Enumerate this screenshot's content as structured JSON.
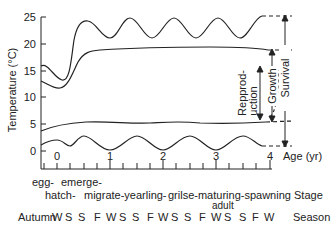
{
  "chart_data": {
    "type": "line",
    "title": "",
    "xlabel": "Age (yr)",
    "ylabel": "Temperature (°C)",
    "ylim": [
      0,
      25
    ],
    "xlim": [
      -0.3,
      4
    ],
    "y_ticks": [
      "0",
      "5",
      "10",
      "15",
      "20",
      "25"
    ],
    "x_ticks": [
      "0",
      "1",
      "2",
      "3",
      "4"
    ],
    "grid": false,
    "series": [
      {
        "name": "Upper survival limit",
        "x": [
          -0.3,
          0.1,
          0.55,
          1.0,
          1.4,
          1.9,
          2.4,
          2.9,
          3.4,
          3.65,
          4.0
        ],
        "values": [
          16,
          13,
          24,
          21,
          24.5,
          21,
          24.5,
          21,
          24.5,
          25,
          25
        ]
      },
      {
        "name": "Upper growth limit",
        "x": [
          -0.3,
          0.05,
          0.6,
          1.0,
          2.0,
          3.0,
          3.6,
          4.0
        ],
        "values": [
          13,
          11.8,
          18.5,
          18.9,
          19.1,
          19.1,
          18.5,
          18
        ]
      },
      {
        "name": "Lower growth limit",
        "x": [
          -0.3,
          0.5,
          1.0,
          2.0,
          3.0,
          3.6,
          4.0
        ],
        "values": [
          3.8,
          5.3,
          5.1,
          5.5,
          5.2,
          5.4,
          5.5
        ]
      },
      {
        "name": "Lower survival limit",
        "x": [
          -0.3,
          0.0,
          0.25,
          0.5,
          1.0,
          1.5,
          2.0,
          2.5,
          3.0,
          3.5,
          3.75,
          4.0
        ],
        "values": [
          1.0,
          2.0,
          1.0,
          2.8,
          0.2,
          2.8,
          0.2,
          2.8,
          0.2,
          2.8,
          0.8,
          0.8
        ]
      }
    ],
    "annotations": [
      "Survival",
      "Growth",
      "Repprod-uction"
    ]
  },
  "axis": {
    "y_label": "Temperature (°C)",
    "x_label": "Age (yr)",
    "y_ticks": [
      "25",
      "20",
      "15",
      "10",
      "5",
      "0"
    ],
    "x_ticks": [
      "0",
      "1",
      "2",
      "3",
      "4"
    ]
  },
  "brackets": {
    "survival": "Survival",
    "growth": "Growth",
    "reproduction_line1": "Repprod-",
    "reproduction_line2": "uction"
  },
  "stages": {
    "row1": [
      {
        "text": "egg-",
        "x": 18
      },
      {
        "text": "emerge-",
        "x": 60
      }
    ],
    "row2": [
      {
        "text": "hatch-",
        "x": 44
      },
      {
        "text": "migrate-yearling-",
        "x": 84
      },
      {
        "text": "grilse-maturing-spawning",
        "x": 168
      }
    ],
    "adult": "adult",
    "label": "Stage"
  },
  "seasons": {
    "first": "Autumn",
    "items": [
      "W",
      "S",
      "S",
      "F",
      "W",
      "S",
      "S",
      "F",
      "W",
      "S",
      "S",
      "F",
      "W",
      "S",
      "S",
      "F",
      "W"
    ],
    "label": "Season"
  }
}
